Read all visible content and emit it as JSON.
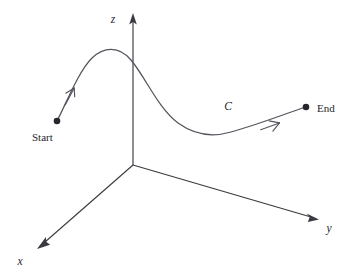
{
  "figure": {
    "background_color": "#ffffff",
    "axis_color": "#3a3a42",
    "curve_color": "#55555e",
    "dot_color": "#26262c",
    "label_color": "#26262c"
  },
  "axes": {
    "origin": {
      "x": 133,
      "y": 165
    },
    "items": [
      {
        "name": "z",
        "label": "z",
        "label_x": 113,
        "label_y": 22,
        "from": {
          "x": 133,
          "y": 165
        },
        "to": {
          "x": 133,
          "y": 14
        },
        "arrow": true
      },
      {
        "name": "y",
        "label": "y",
        "label_x": 327,
        "label_y": 231,
        "from": {
          "x": 133,
          "y": 165
        },
        "to": {
          "x": 318,
          "y": 219
        },
        "arrow": true
      },
      {
        "name": "x",
        "label": "x",
        "label_x": 16,
        "label_y": 264,
        "from": {
          "x": 133,
          "y": 165
        },
        "to": {
          "x": 38,
          "y": 248
        },
        "arrow": true
      }
    ]
  },
  "curve": {
    "label": "C",
    "label_x": 224,
    "label_y": 110,
    "path": "M 57,121 C 66,104 78,72 92,58 C 103,47 119,45 131,60 C 146,78 158,108 178,123 C 196,136 214,137 231,132 C 257,125 287,113 306,107",
    "direction_arrows": [
      {
        "name": "start-direction-arrow",
        "x": 70,
        "y": 96,
        "angle": -62
      },
      {
        "name": "end-direction-arrow",
        "x": 271,
        "y": 125,
        "angle": -22
      }
    ]
  },
  "endpoints": [
    {
      "name": "start",
      "label": "Start",
      "dot_x": 57,
      "dot_y": 121,
      "dot_r": 3.2,
      "label_x": 32,
      "label_y": 141
    },
    {
      "name": "end",
      "label": "End",
      "dot_x": 306,
      "dot_y": 107,
      "dot_r": 3.2,
      "label_x": 317,
      "label_y": 112
    }
  ]
}
